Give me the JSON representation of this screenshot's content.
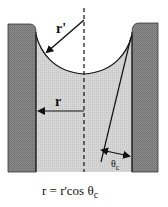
{
  "diagram": {
    "labels": {
      "r_prime": "r'",
      "r": "r",
      "theta_base": "θ",
      "theta_sub": "c"
    },
    "formula": {
      "prefix": "r = r'cos θ",
      "sub": "c"
    },
    "colors": {
      "wall": "#8a8a8a",
      "liquid": "#d2d2d2",
      "line": "#111111",
      "background": "#ffffff"
    },
    "elements": [
      {
        "name": "left-capillary-wall"
      },
      {
        "name": "right-capillary-wall"
      },
      {
        "name": "liquid-column"
      },
      {
        "name": "meniscus-curve"
      },
      {
        "name": "center-axis-dashed-line"
      },
      {
        "name": "r-prime-arrow"
      },
      {
        "name": "r-arrow"
      },
      {
        "name": "tangent-line"
      },
      {
        "name": "contact-angle-arrow"
      }
    ]
  }
}
